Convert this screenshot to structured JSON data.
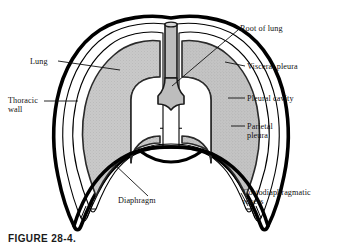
{
  "figure": {
    "caption": "FIGURE 28-4."
  },
  "colors": {
    "background": "#ffffff",
    "outline": "#000000",
    "lung_fill": "#c6c6c6",
    "trachea_fill": "#bdbdbd",
    "cavity_fill": "#ffffff",
    "text": "#111111"
  },
  "labels": {
    "lung": "Lung",
    "thoracic_wall": "Thoracic\nwall",
    "diaphragm": "Diaphragm",
    "root_of_lung": "Root of lung",
    "visceral_pleura": "Visceral pleura",
    "pleural_cavity": "Pleural cavity",
    "parietal_pleura": "Parietal\npleura",
    "costodiaphragmatic_recess": "Costodiaphragmatic\nrecess"
  },
  "structures": [
    "thoracic wall",
    "parietal pleura",
    "pleural cavity",
    "visceral pleura",
    "left lung",
    "right lung",
    "trachea",
    "root of lung",
    "diaphragm",
    "costodiaphragmatic recess"
  ]
}
